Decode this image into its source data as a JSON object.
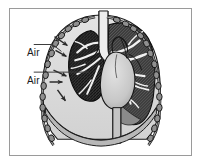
{
  "figure": {
    "frame_color": "#9a9a9a",
    "background_color": "#ffffff"
  },
  "labels": [
    {
      "id": "air-upper",
      "text": "Air"
    },
    {
      "id": "air-lower",
      "text": "Air"
    }
  ],
  "anatomy": {
    "pleural_space_fill": "#d9d9d9",
    "collapsed_lung_fill": "#efefef",
    "lung_tissue_dark": "#2b2b2b",
    "lung_tissue_mid": "#6e6e6e",
    "heart_fill": "#cfcfcf",
    "rib_fill": "#8c8c8c",
    "outline_color": "#111111",
    "parts": [
      "ribs-left",
      "ribs-right",
      "collapsed-left-lung",
      "right-lung",
      "heart",
      "trachea",
      "bronchi",
      "diaphragm",
      "pleural-air-space"
    ]
  },
  "arrows": {
    "color": "#2a2a2a",
    "count": 5,
    "meaning": "air entering pleural space"
  },
  "leaders": {
    "color": "#3a3a3a",
    "count": 2
  }
}
